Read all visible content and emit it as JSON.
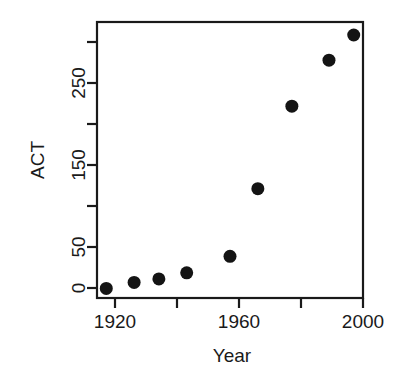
{
  "chart_data": {
    "type": "scatter",
    "title": "",
    "xlabel": "Year",
    "ylabel": "ACT",
    "xlim": [
      1914,
      2000
    ],
    "ylim": [
      -6,
      312
    ],
    "grid": false,
    "legend": null,
    "x_ticks": [
      1920,
      1940,
      1960,
      1980,
      2000
    ],
    "x_tick_labels": [
      "1920",
      "1940",
      "1960",
      "1980",
      "2000"
    ],
    "x_tick_labels_shown": [
      "1920",
      "",
      "1960",
      "",
      "2000"
    ],
    "y_ticks": [
      0,
      50,
      100,
      150,
      200,
      250,
      300
    ],
    "y_tick_labels": [
      "0",
      "50",
      "100",
      "150",
      "200",
      "250",
      "300"
    ],
    "y_tick_labels_shown": [
      "0",
      "50",
      "",
      "150",
      "",
      "250",
      ""
    ],
    "marker": "filled-circle",
    "marker_color": "#141414",
    "x": [
      1917,
      1926,
      1934,
      1943,
      1957,
      1966,
      1977,
      1989,
      1997
    ],
    "y": [
      5,
      12,
      16,
      23,
      42,
      120,
      215,
      268,
      297
    ],
    "points": [
      {
        "x": 1917,
        "y": 5
      },
      {
        "x": 1926,
        "y": 12
      },
      {
        "x": 1934,
        "y": 16
      },
      {
        "x": 1943,
        "y": 23
      },
      {
        "x": 1957,
        "y": 42
      },
      {
        "x": 1966,
        "y": 120
      },
      {
        "x": 1977,
        "y": 215
      },
      {
        "x": 1989,
        "y": 268
      },
      {
        "x": 1997,
        "y": 297
      }
    ]
  },
  "axis_titles": {
    "x": "Year",
    "y": "ACT"
  },
  "colors": {
    "axis": "#1a1a1a",
    "marker": "#141414",
    "background": "#ffffff"
  }
}
